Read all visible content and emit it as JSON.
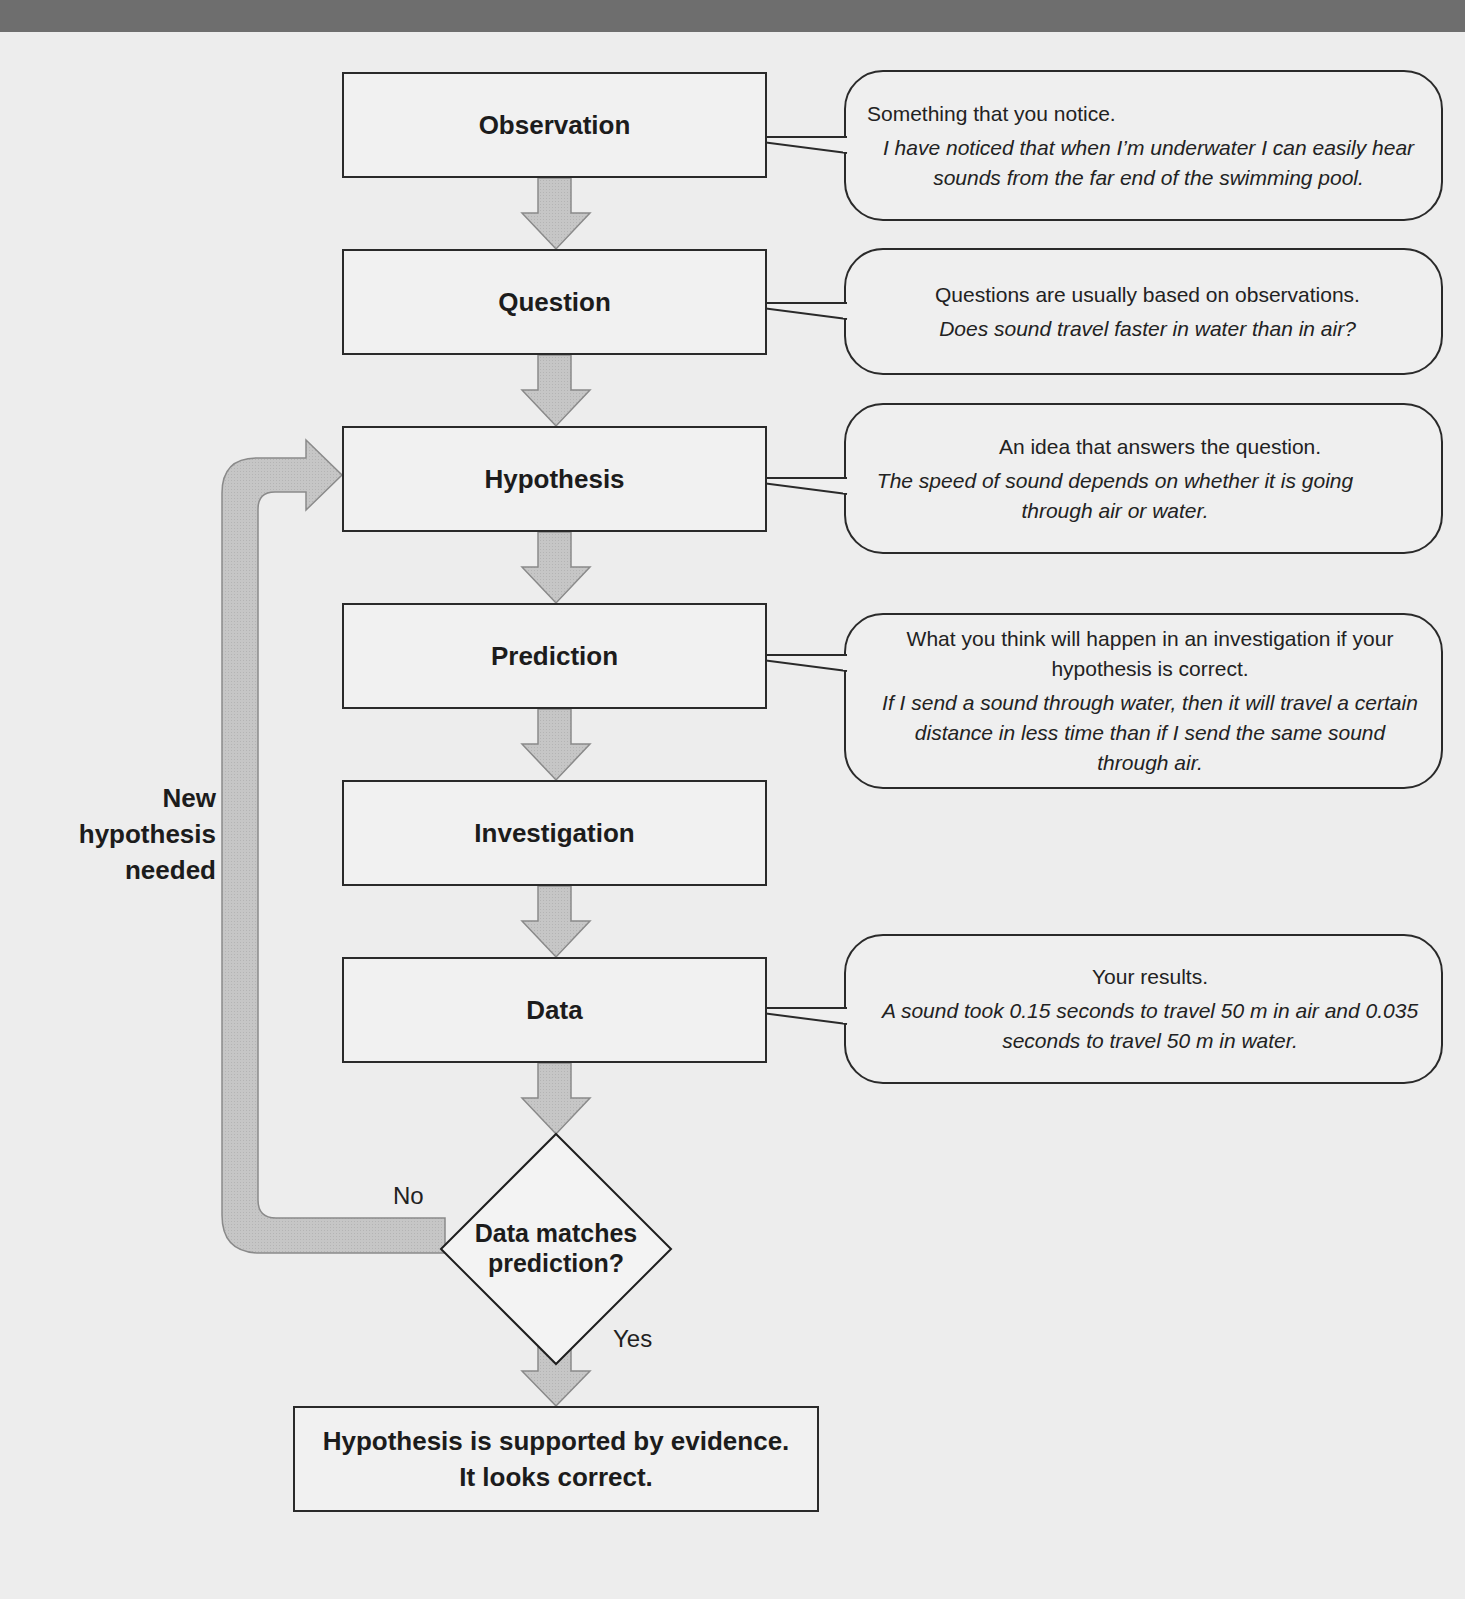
{
  "colors": {
    "background": "#ededed",
    "topbar": "#6e6e6e",
    "arrow_fill": "#c4c4c4",
    "arrow_stroke": "#8a8a8a",
    "box_border": "#2a2a2a"
  },
  "steps": [
    {
      "label": "Observation",
      "callout": {
        "definition": "Something that you notice.",
        "example": "I have noticed that when I’m underwater I can easily hear sounds from the far end of the swimming pool."
      }
    },
    {
      "label": "Question",
      "callout": {
        "definition": "Questions are usually  based on observations.",
        "example": "Does sound travel faster in water than in air?"
      }
    },
    {
      "label": "Hypothesis",
      "callout": {
        "definition": "An idea that answers the question.",
        "example": "The speed of sound depends on whether it is going through air or water."
      }
    },
    {
      "label": "Prediction",
      "callout": {
        "definition": "What you think will happen in an investigation if your hypothesis is correct.",
        "example": "If I send a sound through water, then it will travel a certain distance in less time than if I send the same sound through air."
      }
    },
    {
      "label": "Investigation",
      "callout": null
    },
    {
      "label": "Data",
      "callout": {
        "definition": "Your results.",
        "example": "A sound took 0.15 seconds to travel 50 m in air and 0.035 seconds to travel 50 m in water."
      }
    }
  ],
  "decision": {
    "line1": "Data matches",
    "line2": "prediction?",
    "no_label": "No",
    "yes_label": "Yes"
  },
  "loop": {
    "line1": "New",
    "line2": "hypothesis",
    "line3": "needed"
  },
  "conclusion": {
    "line1": "Hypothesis is supported by evidence.",
    "line2": "It looks correct."
  }
}
